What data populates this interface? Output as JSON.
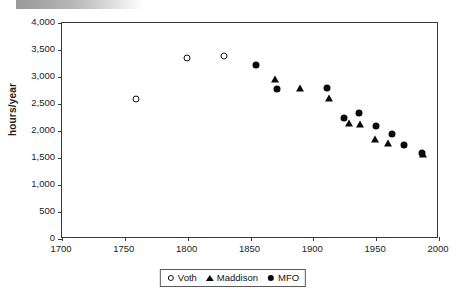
{
  "chart_data": {
    "type": "scatter",
    "title": "",
    "subtitle": "",
    "xlabel": "",
    "ylabel": "hours/year",
    "xlim": [
      1700,
      2000
    ],
    "ylim": [
      0,
      4000
    ],
    "xticks": [
      1700,
      1750,
      1800,
      1850,
      1900,
      1950,
      2000
    ],
    "xtick_labels": [
      "1700",
      "1750",
      "1800",
      "1850",
      "1900",
      "1950",
      "2000"
    ],
    "yticks": [
      0,
      500,
      1000,
      1500,
      2000,
      2500,
      3000,
      3500,
      4000
    ],
    "ytick_labels": [
      "0",
      "500",
      "1,000",
      "1,500",
      "2,000",
      "2,500",
      "3,000",
      "3,500",
      "4,000"
    ],
    "grid": false,
    "legend_position": "bottom-center",
    "series": [
      {
        "name": "Voth",
        "marker": "circle-open",
        "color": "#111111",
        "points": [
          {
            "x": 1760,
            "y": 2580
          },
          {
            "x": 1800,
            "y": 3330
          },
          {
            "x": 1830,
            "y": 3370
          }
        ]
      },
      {
        "name": "Maddison",
        "marker": "triangle-filled",
        "color": "#0a0a0a",
        "points": [
          {
            "x": 1870,
            "y": 2950
          },
          {
            "x": 1890,
            "y": 2770
          },
          {
            "x": 1913,
            "y": 2590
          },
          {
            "x": 1929,
            "y": 2130
          },
          {
            "x": 1938,
            "y": 2110
          },
          {
            "x": 1950,
            "y": 1830
          },
          {
            "x": 1960,
            "y": 1760
          },
          {
            "x": 1988,
            "y": 1550
          }
        ]
      },
      {
        "name": "MFO",
        "marker": "circle-filled",
        "color": "#0a0a0a",
        "points": [
          {
            "x": 1855,
            "y": 3200
          },
          {
            "x": 1872,
            "y": 2760
          },
          {
            "x": 1912,
            "y": 2770
          },
          {
            "x": 1925,
            "y": 2230
          },
          {
            "x": 1937,
            "y": 2310
          },
          {
            "x": 1951,
            "y": 2080
          },
          {
            "x": 1963,
            "y": 1920
          },
          {
            "x": 1973,
            "y": 1720
          },
          {
            "x": 1987,
            "y": 1570
          }
        ]
      }
    ]
  },
  "legend": {
    "entries": [
      {
        "label": "Voth",
        "marker": "circle-open"
      },
      {
        "label": "Maddison",
        "marker": "triangle-filled"
      },
      {
        "label": "MFO",
        "marker": "circle-filled"
      }
    ]
  }
}
